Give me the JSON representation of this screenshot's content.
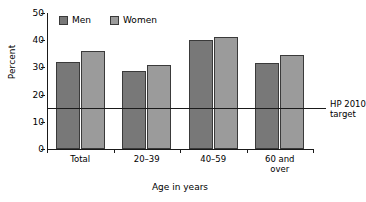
{
  "chart_data": {
    "type": "bar",
    "title": "",
    "xlabel": "Age in years",
    "ylabel": "Percent",
    "categories": [
      "Total",
      "20–39",
      "40–59",
      "60 and over"
    ],
    "series": [
      {
        "name": "Men",
        "color": "#787878",
        "values": [
          32.0,
          28.5,
          40.0,
          31.5
        ]
      },
      {
        "name": "Women",
        "color": "#9b9b9b",
        "values": [
          36.2,
          31.0,
          41.2,
          34.5
        ]
      }
    ],
    "ylim": [
      0,
      50
    ],
    "yticks": [
      "0",
      "10",
      "20",
      "30",
      "40",
      "50"
    ],
    "ytick_values": [
      0,
      10,
      20,
      30,
      40,
      50
    ],
    "grid": false,
    "legend_position": "top-left-inside",
    "annotations": [
      {
        "name": "hp-2010-target",
        "value": 15,
        "label_line1": "HP 2010",
        "label_line2": "target"
      }
    ]
  },
  "legend": {
    "entries": [
      {
        "label": "Men"
      },
      {
        "label": "Women"
      }
    ]
  },
  "axes": {
    "y_title": "Percent",
    "x_title": "Age in years"
  }
}
